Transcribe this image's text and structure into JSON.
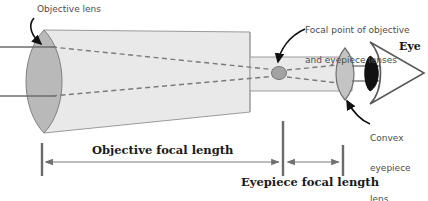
{
  "diagram": {
    "background": "#ffffff",
    "colors": {
      "tube_fill": "#e9e9e9",
      "tube_stroke": "#8c8c8c",
      "lens_fill": "#b9b9b9",
      "lens_stroke": "#7a7a7a",
      "ray_line": "#6e6e6e",
      "dashed_ray": "#7b7b7b",
      "dimension_line": "#7a7a7a",
      "tick_mark": "#6b6b6b",
      "label_text": "#4d4d4d",
      "bold_text": "#1a1a1a",
      "eye_outline": "#5a5a5a",
      "cornea_fill": "#111111",
      "focal_blob": "#9a9a9a"
    },
    "labels": {
      "objective_lens": "Objective lens",
      "focal_point_line1": "Focal point of objective",
      "focal_point_line2": "and eyepiece lenses",
      "eye": "Eye",
      "convex_line1": "Convex",
      "convex_line2": "eyepiece",
      "convex_line3": "lens",
      "objective_focal_length": "Objective focal length",
      "eyepiece_focal_length": "Eyepiece focal length"
    },
    "icons": {
      "objective_pointer": "curved-arrow-icon",
      "focal_pointer": "curved-arrow-icon",
      "convex_pointer": "curved-arrow-icon",
      "eye": "eye-icon",
      "focal_point": "focal-point-icon"
    },
    "measurements": {
      "objective_focal_length_span_px": [
        42,
        283
      ],
      "eyepiece_focal_length_span_px": [
        283,
        343
      ],
      "objective_lens_center_x_px": 42,
      "focal_point_x_px": 279,
      "eyepiece_lens_center_x_px": 345,
      "optical_axis_y_px": 72
    }
  }
}
